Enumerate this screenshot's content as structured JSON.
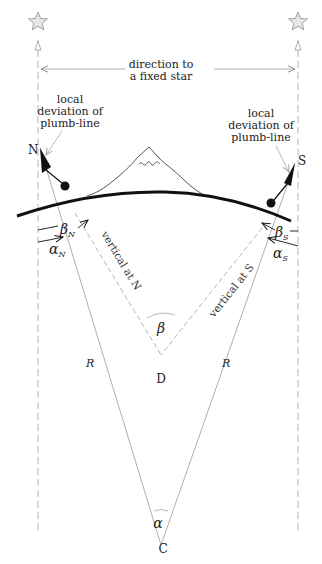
{
  "diagram": {
    "star_direction_label_line1": "direction to",
    "star_direction_label_line2": "a fixed star",
    "left_annotation": {
      "line1": "local",
      "line2": "deviation of",
      "line3": "plumb-line"
    },
    "right_annotation": {
      "line1": "local",
      "line2": "deviation of",
      "line3": "plumb-line"
    },
    "points": {
      "north": "N",
      "south": "S",
      "center_earth": "C",
      "center_geoid": "D"
    },
    "angles": {
      "beta_N": "β",
      "beta_N_sub": "N",
      "alpha_N": "α",
      "alpha_N_sub": "N",
      "beta_S": "β",
      "beta_S_sub": "S",
      "alpha_S": "α",
      "alpha_S_sub": "S",
      "beta": "β",
      "alpha": "α"
    },
    "radius_labels": {
      "left": "R",
      "right": "R"
    },
    "vertical_labels": {
      "north": "vertical at N",
      "south": "vertical at S"
    },
    "icons": [
      "star-icon-left",
      "star-icon-right",
      "mountain-icon",
      "plumb-bob-north",
      "plumb-bob-south"
    ],
    "colors": {
      "line_dark": "#111111",
      "line_light": "#9a9a9a",
      "dash": "#b5b5b5",
      "star_fill": "#e6e6e6",
      "star_stroke": "#9a9a9a"
    }
  }
}
